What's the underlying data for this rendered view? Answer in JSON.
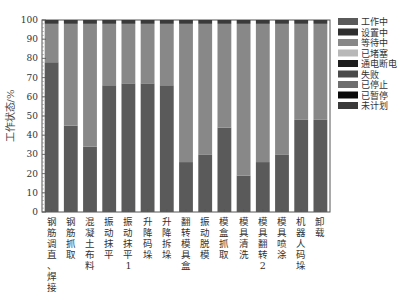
{
  "chart_data": {
    "type": "bar",
    "stacked": true,
    "title": "",
    "xlabel": "",
    "ylabel": "工作状态/%",
    "ylim": [
      0,
      100
    ],
    "yticks": [
      0,
      10,
      20,
      30,
      40,
      50,
      60,
      70,
      80,
      90,
      100
    ],
    "grid": false,
    "legend_position": "right",
    "categories": [
      "钢筋调直、焊接",
      "钢筋抓取",
      "混凝土布料",
      "振动抹平",
      "振动抹平1",
      "升降码垛",
      "升降拆垛",
      "翻转模具盒",
      "振动脱模",
      "模盒抓取",
      "模具清洗",
      "模具翻转2",
      "模具喷涂",
      "机器人码垛",
      "卸载"
    ],
    "series": [
      {
        "name": "工作中",
        "color": "#5a5a5a",
        "values": [
          78,
          45,
          34,
          66,
          67,
          67,
          66,
          26,
          30,
          44,
          19,
          26,
          30,
          48,
          48
        ]
      },
      {
        "name": "设置中",
        "color": "#2e2e2e",
        "values": [
          0,
          0,
          0,
          0,
          0,
          0,
          0,
          0,
          0,
          0,
          0,
          0,
          0,
          0,
          0
        ]
      },
      {
        "name": "等待中",
        "color": "#888888",
        "values": [
          20,
          53,
          64,
          32,
          31,
          31,
          32,
          72,
          68,
          54,
          79,
          72,
          68,
          50,
          50
        ]
      },
      {
        "name": "已堵塞",
        "color": "#b8b8b8",
        "values": [
          0,
          0,
          0,
          0,
          0,
          0,
          0,
          0,
          0,
          0,
          0,
          0,
          0,
          0,
          0
        ]
      },
      {
        "name": "通电断电",
        "color": "#1e1e1e",
        "values": [
          0,
          0,
          0,
          0,
          0,
          0,
          0,
          0,
          0,
          0,
          0,
          0,
          0,
          0,
          0
        ]
      },
      {
        "name": "失败",
        "color": "#4a4a4a",
        "values": [
          0,
          0,
          0,
          0,
          0,
          0,
          0,
          0,
          0,
          0,
          0,
          0,
          0,
          0,
          0
        ]
      },
      {
        "name": "已停止",
        "color": "#6e6e6e",
        "values": [
          0,
          0,
          0,
          0,
          0,
          0,
          0,
          0,
          0,
          0,
          0,
          0,
          0,
          0,
          0
        ]
      },
      {
        "name": "已暂停",
        "color": "#0a0a0a",
        "values": [
          0,
          0,
          0,
          0,
          0,
          0,
          0,
          0,
          0,
          0,
          0,
          0,
          0,
          0,
          0
        ]
      },
      {
        "name": "未计划",
        "color": "#3a3a3a",
        "values": [
          2,
          2,
          2,
          2,
          2,
          2,
          2,
          2,
          2,
          2,
          2,
          2,
          2,
          2,
          2
        ]
      }
    ]
  }
}
